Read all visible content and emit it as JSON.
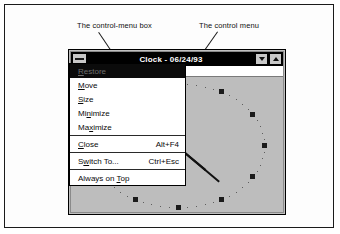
{
  "figure": {
    "annotations": [
      {
        "id": "control-menu-box",
        "text": "The control-menu box"
      },
      {
        "id": "control-menu",
        "text": "The control menu"
      }
    ]
  },
  "window": {
    "title": "Clock - 06/24/93",
    "control_menu_box": {
      "icon": "control-menu-box-icon",
      "tooltip": "Control menu"
    },
    "buttons": [
      {
        "name": "minimize-button",
        "icon": "triangle-down-icon"
      },
      {
        "name": "maximize-button",
        "icon": "triangle-up-icon"
      }
    ]
  },
  "control_menu": {
    "items": [
      {
        "label": "Restore",
        "mnemonic": "R",
        "accelerator": "",
        "disabled": true,
        "highlighted": true
      },
      {
        "label": "Move",
        "mnemonic": "M",
        "accelerator": "",
        "disabled": false,
        "highlighted": false
      },
      {
        "label": "Size",
        "mnemonic": "S",
        "accelerator": "",
        "disabled": false,
        "highlighted": false
      },
      {
        "label": "Minimize",
        "mnemonic": "n",
        "accelerator": "",
        "disabled": false,
        "highlighted": false
      },
      {
        "label": "Maximize",
        "mnemonic": "x",
        "accelerator": "",
        "disabled": false,
        "highlighted": false
      },
      {
        "separator_after": true
      },
      {
        "label": "Close",
        "mnemonic": "C",
        "accelerator": "Alt+F4",
        "disabled": false,
        "highlighted": false
      },
      {
        "separator_after": true
      },
      {
        "label": "Switch To...",
        "mnemonic": "w",
        "accelerator": "Ctrl+Esc",
        "disabled": false,
        "highlighted": false
      },
      {
        "separator_after": true
      },
      {
        "label": "Always on Top",
        "mnemonic": "T",
        "accelerator": "",
        "disabled": false,
        "highlighted": false
      }
    ]
  },
  "clock": {
    "type": "analog",
    "hour_marks": 12,
    "minute_dots": 60,
    "hands": [
      {
        "name": "minute-hand",
        "angle_deg": 40,
        "length": 54
      },
      {
        "name": "hour-hand",
        "angle_deg": 40,
        "length": 36
      }
    ]
  },
  "colors": {
    "title_bar": "#000000",
    "title_text": "#ffffff",
    "window_face": "#c0c0c0",
    "client_face": "#bdbdbd",
    "menu_face": "#ffffff",
    "menu_text": "#0a0a0a",
    "menu_disabled_bg": "#0b0b0b",
    "menu_disabled_text": "#6e6e6e",
    "frame": "#1a1a1a",
    "tick": "#1b1b1b"
  }
}
